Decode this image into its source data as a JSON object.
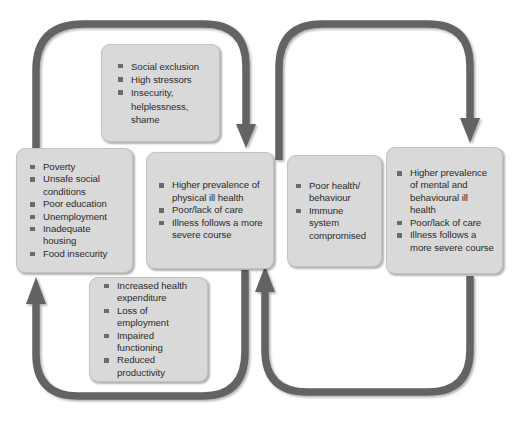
{
  "diagram": {
    "colors": {
      "box_fill": "#d9d9d9",
      "box_border": "#c2c2c2",
      "arrow": "#636363",
      "text": "#2b2b2b",
      "bullet": "#6b6b6b",
      "background": "#ffffff"
    },
    "nodes": [
      {
        "id": "social",
        "name": "social-exclusion-box",
        "items": [
          "Social exclusion",
          "High stressors",
          "Insecurity, helplessness, shame"
        ]
      },
      {
        "id": "poverty",
        "name": "poverty-box",
        "items": [
          "Poverty",
          "Unsafe social conditions",
          "Poor education",
          "Unemployment",
          "Inadequate housing",
          "Food insecurity"
        ]
      },
      {
        "id": "physical",
        "name": "physical-ill-health-box",
        "items": [
          "Higher prevalence of physical ill health",
          "Poor/lack of care",
          "Illness follows a more severe course"
        ]
      },
      {
        "id": "behaviour",
        "name": "health-behaviour-box",
        "items": [
          "Poor health/ behaviour",
          "Immune system compromised"
        ]
      },
      {
        "id": "mental",
        "name": "mental-ill-health-box",
        "items": [
          "Higher prevalence of mental and behavioural ill health",
          "Poor/lack of care",
          "Illness follows a more severe course"
        ]
      },
      {
        "id": "expenditure",
        "name": "economic-consequences-box",
        "items": [
          "Increased health expenditure",
          "Loss of employment",
          "Impaired functioning",
          "Reduced productivity"
        ]
      }
    ],
    "connectors": [
      {
        "name": "poverty-to-physical-top-loop",
        "from": "poverty",
        "to": "physical",
        "direction": "clockwise-over-top"
      },
      {
        "name": "physical-to-mental-top-loop",
        "from": "physical",
        "to": "mental",
        "direction": "clockwise-over-top"
      },
      {
        "name": "physical-to-poverty-bottom-loop",
        "from": "physical",
        "to": "poverty",
        "direction": "counter-clockwise-under-bottom"
      },
      {
        "name": "mental-to-physical-bottom-loop",
        "from": "mental",
        "to": "physical",
        "direction": "counter-clockwise-under-bottom"
      }
    ]
  }
}
